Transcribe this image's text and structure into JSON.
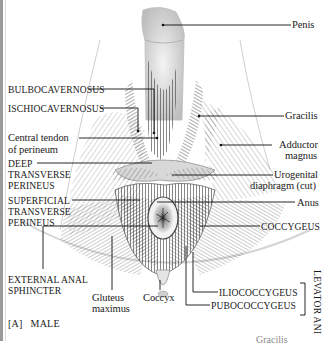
{
  "figure": {
    "panel_label": "[A]",
    "panel_title": "MALE",
    "partial_bottom_text": "Gracilis"
  },
  "labels_left": {
    "bulbocavernosus": "BULBOCAVERNOSUS",
    "ischiocavernosus": "ISCHIOCAVERNOSUS",
    "central_tendon_1": "Central tendon",
    "central_tendon_2": "of perineum",
    "deep_transverse_1": "DEEP",
    "deep_transverse_2": "TRANSVERSE",
    "deep_transverse_3": "PERINEUS",
    "superficial_transverse_1": "SUPERFICIAL",
    "superficial_transverse_2": "TRANSVERSE",
    "superficial_transverse_3": "PERINEUS",
    "external_anal_1": "EXTERNAL ANAL",
    "external_anal_2": "SPHINCTER"
  },
  "labels_right": {
    "penis": "Penis",
    "gracilis": "Gracilis",
    "adductor_1": "Adductor",
    "adductor_2": "magnus",
    "urogenital_1": "Urogenital",
    "urogenital_2": "diaphragm (cut)",
    "anus": "Anus",
    "coccygeus": "COCCYGEUS",
    "iliococcygeus": "ILIOCOCCYGEUS",
    "pubococcygeus": "PUBOCOCCYGEUS",
    "levator_ani": "LEVATOR ANI"
  },
  "labels_bottom": {
    "gluteus_1": "Gluteus",
    "gluteus_2": "maximus",
    "coccyx": "Coccyx"
  }
}
